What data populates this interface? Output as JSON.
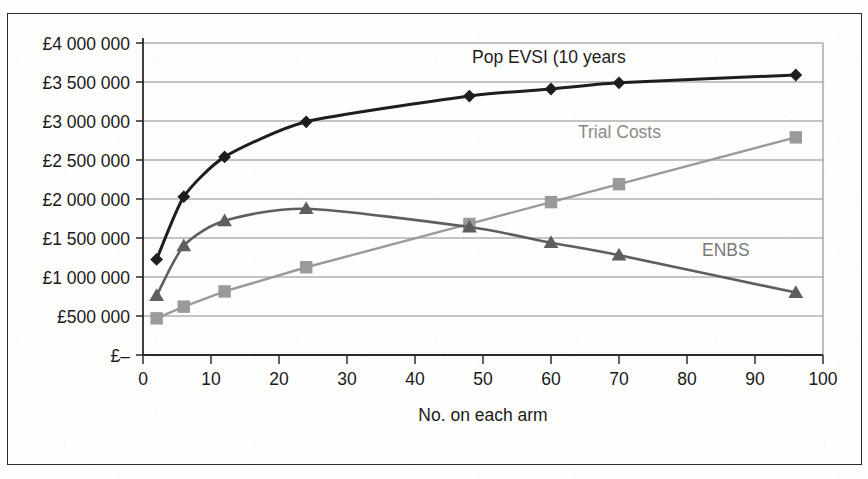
{
  "figure": {
    "background_color": "#fdfdfc",
    "frame_color": "#2a2a2a",
    "gridline_color": "#8c8c8c",
    "axis_color": "#3a3a3a"
  },
  "chart_data": {
    "type": "line",
    "title": "",
    "xlabel": "No. on each arm",
    "ylabel": "",
    "x": [
      2,
      6,
      12,
      24,
      48,
      60,
      70,
      96
    ],
    "xlim": [
      0,
      100
    ],
    "ylim": [
      0,
      4000000
    ],
    "grid": true,
    "legend_position": "inline-annotations",
    "x_tick_labels": [
      "0",
      "10",
      "20",
      "30",
      "40",
      "50",
      "60",
      "70",
      "80",
      "90",
      "100"
    ],
    "x_tick_values": [
      0,
      10,
      20,
      30,
      40,
      50,
      60,
      70,
      80,
      90,
      100
    ],
    "y_tick_labels": [
      "£ 000000",
      "£3 500 000",
      "£3 000 000",
      "£2 500 000",
      "£2 000 000",
      "£1 500 000",
      "£1 000 000",
      "£500 000",
      "£–"
    ],
    "y_tick_values": [
      4000000,
      3500000,
      3000000,
      2500000,
      2000000,
      1500000,
      1000000,
      500000,
      0
    ],
    "series": [
      {
        "name": "Pop EVSI (10 years",
        "annotation_label": "Pop EVSI (10 years",
        "color": "#1e1e1e",
        "marker": "diamond",
        "values": [
          1225000,
          2030000,
          2540000,
          2990000,
          3320000,
          3410000,
          3490000,
          3590000
        ]
      },
      {
        "name": "Trial Costs",
        "annotation_label": "Trial Costs",
        "color": "#9a9a9a",
        "marker": "square",
        "values": [
          470000,
          620000,
          815000,
          1125000,
          1680000,
          1960000,
          2190000,
          2790000
        ]
      },
      {
        "name": "ENBS",
        "annotation_label": "ENBS",
        "color": "#5e5e5e",
        "marker": "triangle",
        "values": [
          760000,
          1400000,
          1720000,
          1875000,
          1640000,
          1440000,
          1280000,
          800000
        ]
      }
    ]
  },
  "y_axis_labels": [
    {
      "text": "£4 000 000"
    },
    {
      "text": "£3 500 000"
    },
    {
      "text": "£3 000 000"
    },
    {
      "text": "£2 500 000"
    },
    {
      "text": "£2 000 000"
    },
    {
      "text": "£1 500 000"
    },
    {
      "text": "£1 000 000"
    },
    {
      "text": "£500 000"
    },
    {
      "text": "£–"
    }
  ],
  "x_axis_labels": [
    {
      "text": "0"
    },
    {
      "text": "10"
    },
    {
      "text": "20"
    },
    {
      "text": "30"
    },
    {
      "text": "40"
    },
    {
      "text": "50"
    },
    {
      "text": "60"
    },
    {
      "text": "70"
    },
    {
      "text": "80"
    },
    {
      "text": "90"
    },
    {
      "text": "100"
    }
  ],
  "x_axis_title": "No. on each arm",
  "annotations": {
    "evsi": "Pop EVSI (10 years",
    "trial_costs": "Trial Costs",
    "enbs": "ENBS"
  }
}
